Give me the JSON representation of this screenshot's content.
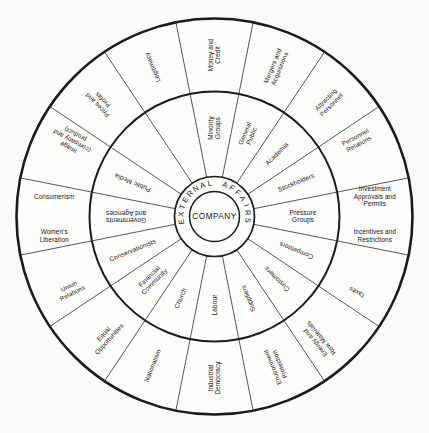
{
  "diagram": {
    "title": "",
    "type": "concentric-wheel",
    "sector_count": 16,
    "hub_label": "COMPANY",
    "core_ring_label": "EXTERNAL AFFAIRS",
    "colors": {
      "stroke": "#1a1a1a",
      "divider": "#2b2b2b",
      "background": "#fbfbf9",
      "sector_fill": "#fdfdfb",
      "text": "#16130f"
    },
    "middle_ring": {
      "name": "stakeholders",
      "items": [
        {
          "index": 0,
          "label": "Minority Groups"
        },
        {
          "index": 1,
          "label": "General Public"
        },
        {
          "index": 2,
          "label": "Academia"
        },
        {
          "index": 3,
          "label": "Stockholders"
        },
        {
          "index": 4,
          "label": "Pressure Groups"
        },
        {
          "index": 5,
          "label": "Competitors"
        },
        {
          "index": 6,
          "label": "Customers"
        },
        {
          "index": 7,
          "label": "Suppliers"
        },
        {
          "index": 8,
          "label": "Labour"
        },
        {
          "index": 9,
          "label": "Church"
        },
        {
          "index": 10,
          "label": "Financial Community"
        },
        {
          "index": 11,
          "label": "Conservationists"
        },
        {
          "index": 12,
          "label": "Governments and Agencies"
        },
        {
          "index": 13,
          "label": "Public Media"
        }
      ]
    },
    "outer_ring": {
      "name": "issues",
      "items": [
        {
          "index": 0,
          "label": "Money and Credit"
        },
        {
          "index": 1,
          "label": "Mergers and Acquisitions"
        },
        {
          "index": 2,
          "label": "Attracting Personnel"
        },
        {
          "index": 3,
          "label": "Personnel Relations"
        },
        {
          "index": 4,
          "label": "Investment Approvals and Permits"
        },
        {
          "index": 5,
          "label": "Incentives and Restrictions"
        },
        {
          "index": 6,
          "label": "Taxes"
        },
        {
          "index": 7,
          "label": "Energy and Raw Materials"
        },
        {
          "index": 8,
          "label": "Environment Protection"
        },
        {
          "index": 9,
          "label": "Industrial Democracy"
        },
        {
          "index": 10,
          "label": "Nationalism"
        },
        {
          "index": 11,
          "label": "Equal Opportunities"
        },
        {
          "index": 12,
          "label": "Union Relations"
        },
        {
          "index": 13,
          "label": "Women's Liberation"
        },
        {
          "index": 14,
          "label": "Consumerism"
        },
        {
          "index": 15,
          "label": "Image (company and product)"
        },
        {
          "index": 16,
          "label": "Prices and Profits"
        },
        {
          "index": 17,
          "label": "Legitimacy"
        }
      ]
    }
  }
}
